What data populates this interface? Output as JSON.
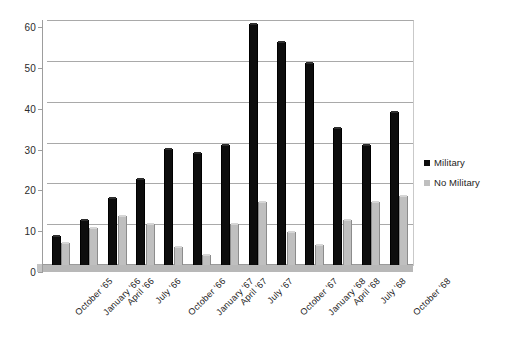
{
  "chart_data": {
    "type": "bar",
    "title": "",
    "subtitle": "",
    "xlabel": "",
    "ylabel": "",
    "ylim": [
      0,
      60
    ],
    "y_ticks": [
      0,
      10,
      20,
      30,
      40,
      50,
      60
    ],
    "grid": true,
    "legend_position": "right",
    "categories": [
      "October '65",
      "January '66",
      "April '66",
      "July '66",
      "October '66",
      "January '67",
      "April '67",
      "July '67",
      "October '67",
      "January '68",
      "April '68",
      "July '68",
      "October '68"
    ],
    "series": [
      {
        "name": "Military",
        "color": "#0d0d0d",
        "values": [
          7,
          11,
          16.5,
          21,
          28.5,
          27.5,
          29.5,
          59,
          54.5,
          49.5,
          33.5,
          29.5,
          37.5
        ]
      },
      {
        "name": "No Military",
        "color": "#bfbfbf",
        "values": [
          5.5,
          9,
          12,
          10,
          4.5,
          2.5,
          10,
          15.5,
          8,
          5,
          11,
          15.5,
          17
        ]
      }
    ]
  },
  "legend": {
    "items": [
      {
        "label": "Military",
        "swatch": "military-swatch"
      },
      {
        "label": "No Military",
        "swatch": "no-military-swatch"
      }
    ]
  }
}
